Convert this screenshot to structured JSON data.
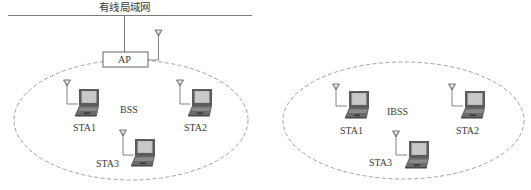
{
  "lan": {
    "title": "有线局域网"
  },
  "ap": {
    "label": "AP"
  },
  "bss": {
    "label": "BSS",
    "stations": [
      {
        "label": "STA1"
      },
      {
        "label": "STA2"
      },
      {
        "label": "STA3"
      }
    ]
  },
  "ibss": {
    "label": "IBSS",
    "stations": [
      {
        "label": "STA1"
      },
      {
        "label": "STA2"
      },
      {
        "label": "STA3"
      }
    ]
  },
  "colors": {
    "line": "#6b6b6b",
    "ellipse_dash": "#8a8a8a",
    "laptop_body": "#5a5a5a",
    "laptop_screen": "#b9b9b9",
    "text": "#3a3a3a"
  }
}
